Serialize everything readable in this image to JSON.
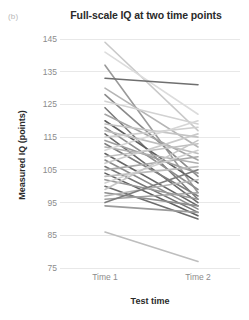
{
  "panel": {
    "label": "(b)"
  },
  "chart_data": {
    "type": "line",
    "title": "Full-scale IQ at two time points",
    "subtitle": "",
    "xlabel": "Test time",
    "ylabel": "Measured IQ (points)",
    "categories": [
      "Time 1",
      "Time 2"
    ],
    "x": [
      1,
      2
    ],
    "xtick_labels": [
      "Time 1",
      "Time 2"
    ],
    "ytick_labels": [
      "75",
      "85",
      "95",
      "105",
      "115",
      "125",
      "135",
      "145"
    ],
    "yticks": [
      75,
      85,
      95,
      105,
      115,
      125,
      135,
      145
    ],
    "ylim": [
      75,
      145
    ],
    "xlim": [
      0.62,
      2.38
    ],
    "grid": "horizontal",
    "legend": "none",
    "annotations": [],
    "colors": {
      "grid": "#e8e8e8",
      "tick_text": "#8c8c8c",
      "axis_text": "#2a2a2a",
      "panel_label": "#b8b8b8",
      "line_dark": "#555555",
      "line_mid": "#999999",
      "line_light": "#cccccc"
    },
    "series_note": "Each line connects one participant's Time 1 and Time 2 full-scale IQ score.",
    "series": [
      {
        "name": "p01",
        "values": [
          144,
          117
        ],
        "color": "#c9c9c9",
        "width": 1.6
      },
      {
        "name": "p02",
        "values": [
          141,
          122
        ],
        "color": "#dcdcdc",
        "width": 1.6
      },
      {
        "name": "p03",
        "values": [
          137,
          98
        ],
        "color": "#9a9a9a",
        "width": 1.6
      },
      {
        "name": "p04",
        "values": [
          133,
          131
        ],
        "color": "#6f6f6f",
        "width": 1.6
      },
      {
        "name": "p05",
        "values": [
          130,
          112
        ],
        "color": "#b5b5b5",
        "width": 1.6
      },
      {
        "name": "p06",
        "values": [
          128,
          103
        ],
        "color": "#8a8a8a",
        "width": 1.6
      },
      {
        "name": "p07",
        "values": [
          126,
          119
        ],
        "color": "#d2d2d2",
        "width": 1.6
      },
      {
        "name": "p08",
        "values": [
          124,
          96
        ],
        "color": "#7a7a7a",
        "width": 1.6
      },
      {
        "name": "p09",
        "values": [
          122,
          108
        ],
        "color": "#a5a5a5",
        "width": 1.6
      },
      {
        "name": "p10",
        "values": [
          120,
          101
        ],
        "color": "#5f5f5f",
        "width": 1.6
      },
      {
        "name": "p11",
        "values": [
          119,
          115
        ],
        "color": "#c4c4c4",
        "width": 1.6
      },
      {
        "name": "p12",
        "values": [
          118,
          99
        ],
        "color": "#8f8f8f",
        "width": 1.6
      },
      {
        "name": "p13",
        "values": [
          117,
          110
        ],
        "color": "#bdbdbd",
        "width": 1.6
      },
      {
        "name": "p14",
        "values": [
          116,
          95
        ],
        "color": "#6a6a6a",
        "width": 1.6
      },
      {
        "name": "p15",
        "values": [
          115,
          118
        ],
        "color": "#cfcfcf",
        "width": 1.6
      },
      {
        "name": "p16",
        "values": [
          114,
          104
        ],
        "color": "#9e9e9e",
        "width": 1.6
      },
      {
        "name": "p17",
        "values": [
          113,
          97
        ],
        "color": "#7f7f7f",
        "width": 1.6
      },
      {
        "name": "p18",
        "values": [
          112,
          107
        ],
        "color": "#b0b0b0",
        "width": 1.6
      },
      {
        "name": "p19",
        "values": [
          111,
          120
        ],
        "color": "#d6d6d6",
        "width": 1.6
      },
      {
        "name": "p20",
        "values": [
          110,
          94
        ],
        "color": "#656565",
        "width": 1.6
      },
      {
        "name": "p21",
        "values": [
          109,
          113
        ],
        "color": "#c0c0c0",
        "width": 1.6
      },
      {
        "name": "p22",
        "values": [
          108,
          93
        ],
        "color": "#8b8b8b",
        "width": 1.6
      },
      {
        "name": "p23",
        "values": [
          107,
          116
        ],
        "color": "#cacaca",
        "width": 1.6
      },
      {
        "name": "p24",
        "values": [
          106,
          92
        ],
        "color": "#747474",
        "width": 1.6
      },
      {
        "name": "p25",
        "values": [
          105,
          109
        ],
        "color": "#a8a8a8",
        "width": 1.6
      },
      {
        "name": "p26",
        "values": [
          104,
          91
        ],
        "color": "#606060",
        "width": 1.6
      },
      {
        "name": "p27",
        "values": [
          103,
          106
        ],
        "color": "#bcbcbc",
        "width": 1.6
      },
      {
        "name": "p28",
        "values": [
          102,
          96
        ],
        "color": "#979797",
        "width": 1.6
      },
      {
        "name": "p29",
        "values": [
          101,
          111
        ],
        "color": "#d0d0d0",
        "width": 1.6
      },
      {
        "name": "p30",
        "values": [
          100,
          90
        ],
        "color": "#6d6d6d",
        "width": 1.6
      },
      {
        "name": "p31",
        "values": [
          99,
          114
        ],
        "color": "#c6c6c6",
        "width": 1.6
      },
      {
        "name": "p32",
        "values": [
          98,
          94
        ],
        "color": "#8d8d8d",
        "width": 1.6
      },
      {
        "name": "p33",
        "values": [
          97,
          102
        ],
        "color": "#b3b3b3",
        "width": 1.6
      },
      {
        "name": "p34",
        "values": [
          96,
          98
        ],
        "color": "#a0a0a0",
        "width": 1.6
      },
      {
        "name": "p35",
        "values": [
          95,
          105
        ],
        "color": "#7c7c7c",
        "width": 1.6
      },
      {
        "name": "p36",
        "values": [
          94,
          92
        ],
        "color": "#9b9b9b",
        "width": 1.6
      },
      {
        "name": "p37",
        "values": [
          86,
          77
        ],
        "color": "#bebebe",
        "width": 1.6
      }
    ]
  }
}
